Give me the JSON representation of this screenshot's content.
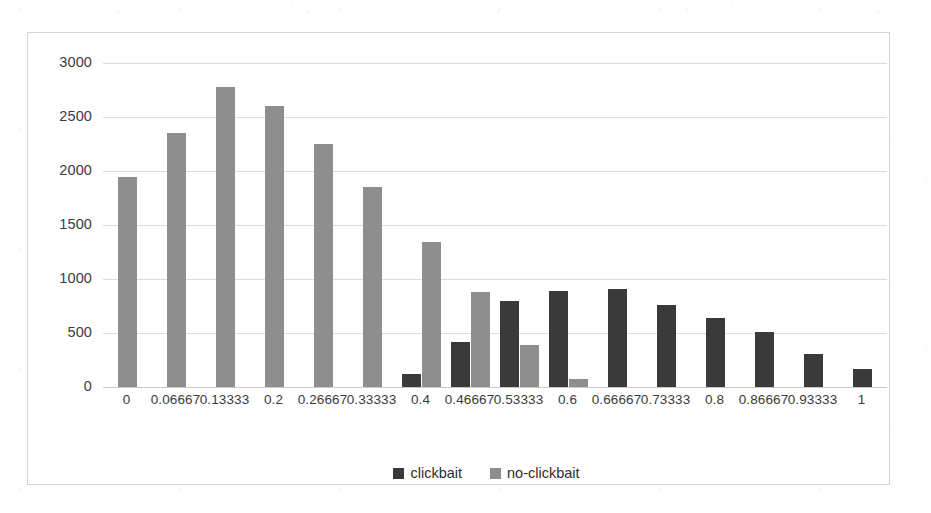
{
  "chart_data": {
    "type": "bar",
    "title": "",
    "subtitle": "",
    "xlabel": "",
    "ylabel": "",
    "ylim": [
      0,
      3000
    ],
    "ytick_step": 500,
    "ytick_labels": [
      "0",
      "500",
      "1000",
      "1500",
      "2000",
      "2500",
      "3000"
    ],
    "ytick_values": [
      0,
      500,
      1000,
      1500,
      2000,
      2500,
      3000
    ],
    "grid": true,
    "grid_axis": "y",
    "legend_position": "bottom-center",
    "categories": [
      "0",
      "0.06667",
      "0.13333",
      "0.2",
      "0.26667",
      "0.33333",
      "0.4",
      "0.46667",
      "0.53333",
      "0.6",
      "0.66667",
      "0.73333",
      "0.8",
      "0.86667",
      "0.93333",
      "1"
    ],
    "series": [
      {
        "name": "clickbait",
        "color": "#3a3a3a",
        "values": [
          0,
          0,
          0,
          0,
          0,
          0,
          120,
          420,
          800,
          890,
          910,
          760,
          635,
          510,
          305,
          165
        ]
      },
      {
        "name": "no-clickbait",
        "color": "#8e8e8e",
        "values": [
          1944,
          2352,
          2778,
          2600,
          2250,
          1850,
          1340,
          880,
          390,
          75,
          0,
          0,
          0,
          0,
          0,
          0
        ]
      }
    ],
    "annotations": []
  },
  "legend": {
    "entries": [
      {
        "label": "clickbait",
        "swatch": "clickbait"
      },
      {
        "label": "no-clickbait",
        "swatch": "noclickbait"
      }
    ]
  },
  "colors": {
    "clickbait": "#3a3a3a",
    "no_clickbait": "#8e8e8e",
    "gridline": "#dcdcdc",
    "frame_border": "#d4d4d4",
    "text": "#3b3b3b",
    "background": "#ffffff"
  }
}
